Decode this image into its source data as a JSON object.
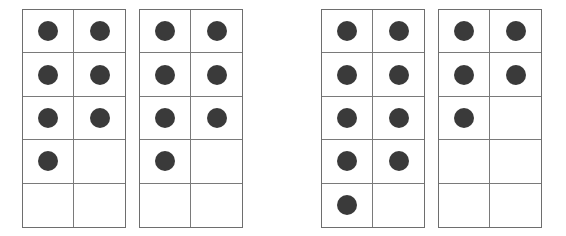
{
  "groups": [
    {
      "name": "left-pair",
      "frames": [
        {
          "counters": 7,
          "capacity": 10
        },
        {
          "counters": 7,
          "capacity": 10
        }
      ]
    },
    {
      "name": "right-pair",
      "frames": [
        {
          "counters": 9,
          "capacity": 10
        },
        {
          "counters": 5,
          "capacity": 10
        }
      ]
    }
  ],
  "colors": {
    "counter": "#3a3a3a",
    "grid_line": "#7a7a7a",
    "background": "#ffffff"
  }
}
